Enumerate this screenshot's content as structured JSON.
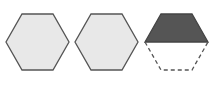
{
  "diagram": {
    "colors": {
      "fill_light": "#e8e8e8",
      "fill_dark": "#555555",
      "stroke": "#555555",
      "dash_stroke": "#555555"
    },
    "shapes": [
      {
        "name": "hexagon-1",
        "type": "full",
        "points": "22,14 53,14 69,42 53,70 22,70 6,42"
      },
      {
        "name": "hexagon-2",
        "type": "full",
        "points": "91,14 122,14 138,42 122,70 91,70 75,42"
      },
      {
        "name": "hexagon-3-top-half",
        "type": "half-shaded",
        "points": "161,14 192,14 208,42 145,42"
      },
      {
        "name": "hexagon-3-bottom-half",
        "type": "dashed-outline",
        "points": "145,42 161,70 192,70 208,42"
      }
    ]
  }
}
